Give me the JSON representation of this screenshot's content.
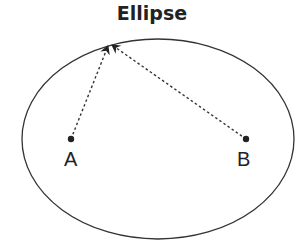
{
  "title": "Ellipse",
  "points": [
    {
      "label": "A",
      "x": 71,
      "y": 139
    },
    {
      "label": "B",
      "x": 246,
      "y": 139
    }
  ],
  "ellipse": {
    "cx": 158,
    "cy": 139,
    "rx": 136,
    "ry": 100
  },
  "apex": {
    "x": 110,
    "y": 43
  },
  "colors": {
    "stroke": "#222222",
    "background": "#ffffff"
  }
}
